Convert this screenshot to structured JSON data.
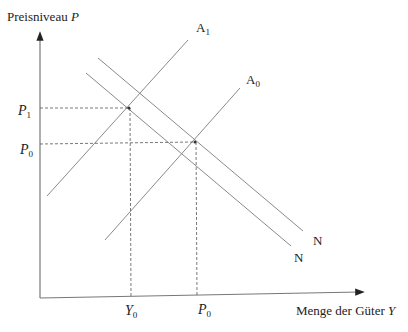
{
  "diagram": {
    "y_axis_label": "Preisniveau",
    "y_axis_var": "P",
    "x_axis_label": "Menge der Güter",
    "x_axis_var": "Y",
    "curves": [
      {
        "id": "A1",
        "name": "A",
        "sub": "1",
        "type": "supply"
      },
      {
        "id": "A0",
        "name": "A",
        "sub": "0",
        "type": "supply"
      },
      {
        "id": "N_upper",
        "name": "N",
        "type": "demand"
      },
      {
        "id": "N_lower",
        "name": "N",
        "type": "demand"
      }
    ],
    "y_ticks": [
      {
        "var": "P",
        "sub": "1"
      },
      {
        "var": "P",
        "sub": "0"
      }
    ],
    "x_ticks": [
      {
        "var": "Y",
        "sub": "0"
      },
      {
        "var": "P",
        "sub": "0"
      }
    ],
    "colors": {
      "line": "#8a8a8a",
      "axis": "#777777",
      "dashed": "#555555",
      "text": "#222222"
    }
  }
}
